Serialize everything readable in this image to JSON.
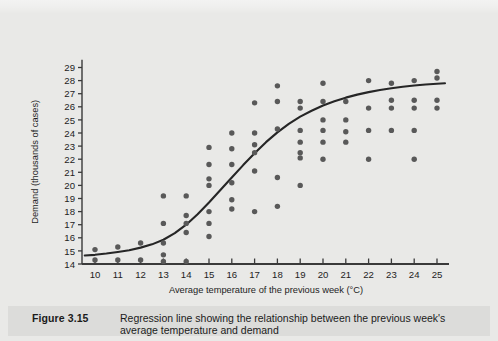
{
  "figure": {
    "number_label": "Figure 3.15",
    "caption": "Regression line showing the relationship between the previous week's average temperature and demand"
  },
  "colors": {
    "page_background": "#e9e9e7",
    "caption_background": "#dcdcda",
    "point": "#595959",
    "line": "#262626",
    "axis": "#3a3a3a",
    "text": "#1b1b1b"
  },
  "chart_data": {
    "type": "scatter",
    "title": "",
    "xlabel": "Average temperature of the previous week (°C)",
    "ylabel": "Demand (thousands of cases)",
    "xlim": [
      9.4,
      25.6
    ],
    "ylim": [
      14,
      29.6
    ],
    "xticks": [
      10,
      11,
      12,
      13,
      14,
      15,
      16,
      17,
      18,
      19,
      20,
      21,
      22,
      23,
      24,
      25
    ],
    "yticks": [
      14,
      15,
      16,
      17,
      18,
      19,
      20,
      21,
      22,
      23,
      24,
      25,
      26,
      27,
      28,
      29
    ],
    "xtick_labels": [
      "10",
      "11",
      "12",
      "13",
      "14",
      "15",
      "16",
      "17",
      "18",
      "19",
      "20",
      "21",
      "22",
      "23",
      "24",
      "25"
    ],
    "ytick_labels": [
      "14",
      "15",
      "16",
      "17",
      "18",
      "19",
      "20",
      "21",
      "22",
      "23",
      "24",
      "25",
      "26",
      "27",
      "28",
      "29"
    ],
    "grid": false,
    "legend": false,
    "points": [
      [
        10,
        15.1
      ],
      [
        10,
        14.3
      ],
      [
        11,
        15.3
      ],
      [
        11,
        14.3
      ],
      [
        12,
        15.6
      ],
      [
        12,
        14.3
      ],
      [
        13,
        19.2
      ],
      [
        13,
        17.1
      ],
      [
        13,
        15.6
      ],
      [
        13,
        14.7
      ],
      [
        13,
        14.2
      ],
      [
        14,
        19.2
      ],
      [
        14,
        17.7
      ],
      [
        14,
        17.1
      ],
      [
        14,
        16.4
      ],
      [
        14,
        14.2
      ],
      [
        15,
        22.9
      ],
      [
        15,
        21.6
      ],
      [
        15,
        20.5
      ],
      [
        15,
        20.0
      ],
      [
        15,
        18.0
      ],
      [
        15,
        17.1
      ],
      [
        15,
        16.1
      ],
      [
        16,
        24.0
      ],
      [
        16,
        22.8
      ],
      [
        16,
        21.6
      ],
      [
        16,
        20.2
      ],
      [
        16,
        18.9
      ],
      [
        16,
        18.2
      ],
      [
        17,
        26.3
      ],
      [
        17,
        24.0
      ],
      [
        17,
        23.1
      ],
      [
        17,
        22.5
      ],
      [
        17,
        21.1
      ],
      [
        17,
        18.0
      ],
      [
        18,
        27.6
      ],
      [
        18,
        26.4
      ],
      [
        18,
        24.3
      ],
      [
        18,
        20.6
      ],
      [
        18,
        18.4
      ],
      [
        19,
        26.4
      ],
      [
        19,
        25.9
      ],
      [
        19,
        24.2
      ],
      [
        19,
        23.3
      ],
      [
        19,
        22.5
      ],
      [
        19,
        22.1
      ],
      [
        19,
        20.0
      ],
      [
        20,
        27.8
      ],
      [
        20,
        26.4
      ],
      [
        20,
        25.0
      ],
      [
        20,
        24.2
      ],
      [
        20,
        23.3
      ],
      [
        20,
        22.0
      ],
      [
        21,
        26.4
      ],
      [
        21,
        25.0
      ],
      [
        21,
        24.1
      ],
      [
        21,
        23.3
      ],
      [
        22,
        28.0
      ],
      [
        22,
        25.9
      ],
      [
        22,
        24.2
      ],
      [
        22,
        22.0
      ],
      [
        23,
        27.8
      ],
      [
        23,
        26.5
      ],
      [
        23,
        25.9
      ],
      [
        23,
        24.2
      ],
      [
        24,
        28.0
      ],
      [
        24,
        26.5
      ],
      [
        24,
        25.9
      ],
      [
        24,
        24.2
      ],
      [
        24,
        22.0
      ],
      [
        25,
        28.7
      ],
      [
        25,
        28.2
      ],
      [
        25,
        26.5
      ],
      [
        25,
        25.9
      ]
    ],
    "regression_line": {
      "name": "Regression line",
      "shape": "logistic",
      "points": [
        [
          9.55,
          14.65
        ],
        [
          10,
          14.7
        ],
        [
          10.5,
          14.8
        ],
        [
          11,
          14.92
        ],
        [
          11.5,
          15.05
        ],
        [
          12,
          15.25
        ],
        [
          12.5,
          15.5
        ],
        [
          13,
          15.85
        ],
        [
          13.5,
          16.35
        ],
        [
          14,
          17.0
        ],
        [
          14.5,
          17.8
        ],
        [
          15,
          18.7
        ],
        [
          15.5,
          19.65
        ],
        [
          16,
          20.6
        ],
        [
          16.5,
          21.55
        ],
        [
          17,
          22.45
        ],
        [
          17.5,
          23.3
        ],
        [
          18,
          24.05
        ],
        [
          18.5,
          24.7
        ],
        [
          19,
          25.25
        ],
        [
          19.5,
          25.7
        ],
        [
          20,
          26.1
        ],
        [
          20.5,
          26.42
        ],
        [
          21,
          26.7
        ],
        [
          21.5,
          26.93
        ],
        [
          22,
          27.12
        ],
        [
          22.5,
          27.28
        ],
        [
          23,
          27.42
        ],
        [
          23.5,
          27.53
        ],
        [
          24,
          27.62
        ],
        [
          24.5,
          27.7
        ],
        [
          25,
          27.76
        ],
        [
          25.35,
          27.8
        ]
      ]
    }
  }
}
